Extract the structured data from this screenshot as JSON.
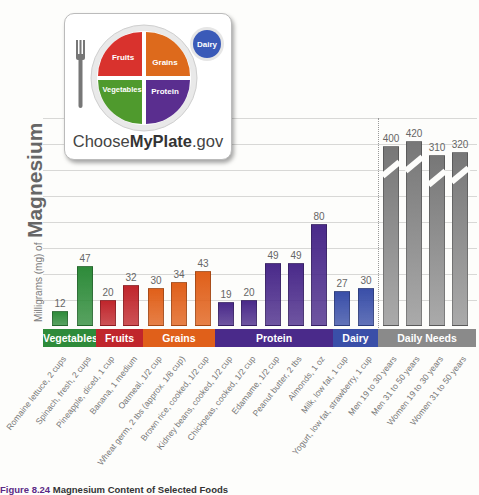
{
  "logo": {
    "sections": [
      "Fruits",
      "Grains",
      "Vegetables",
      "Protein"
    ],
    "dairy": "Dairy",
    "brand_prefix": "Choose",
    "brand_bold": "MyPlate",
    "brand_suffix": ".gov"
  },
  "y_axis": {
    "small": "Milligrams (mg) of",
    "big": "Magnesium"
  },
  "caption": {
    "label": "Figure 8.24",
    "text": "Magnesium Content of Selected Foods"
  },
  "bands": [
    {
      "name": "Vegetables",
      "color": "#2e8b3a"
    },
    {
      "name": "Fruits",
      "color": "#c0262c"
    },
    {
      "name": "Grains",
      "color": "#e0601a"
    },
    {
      "name": "Protein",
      "color": "#4a2a8a"
    },
    {
      "name": "Dairy",
      "color": "#3a4fa8"
    },
    {
      "name": "Daily Needs",
      "color": "#8a8a8a"
    }
  ],
  "chart_data": {
    "type": "bar",
    "title": "Magnesium Content of Selected Foods",
    "ylabel": "Milligrams (mg) of Magnesium",
    "xlabel": "",
    "grid": true,
    "categories": [
      "Romaine lettuce, 2 cups",
      "Spinach, fresh, 2 cups",
      "Pineapple, diced, 1 cup",
      "Banana, 1 medium",
      "Oatmeal, 1/2 cup",
      "Wheat germ, 2 tbs (approx. 1/8 cup)",
      "Brown rice, cooked, 1/2 cup",
      "Kidney beans, cooked, 1/2 cup",
      "Chickpeas, cooked, 1/2 cup",
      "Edamame, 1/2 cup",
      "Peanut butter, 2 tbs",
      "Almonds, 1 oz",
      "Milk, low fat, 1 cup",
      "Yogurt, low fat, strawberry, 1 cup",
      "Men 19 to 30 years",
      "Men 31 to 50 years",
      "Women 19 to 30 years",
      "Women 31 to 50 years"
    ],
    "values": [
      12,
      47,
      20,
      32,
      30,
      34,
      43,
      19,
      20,
      49,
      49,
      80,
      27,
      30,
      400,
      420,
      310,
      320
    ],
    "groups": [
      "Vegetables",
      "Vegetables",
      "Fruits",
      "Fruits",
      "Grains",
      "Grains",
      "Grains",
      "Protein",
      "Protein",
      "Protein",
      "Protein",
      "Protein",
      "Dairy",
      "Dairy",
      "Daily Needs",
      "Daily Needs",
      "Daily Needs",
      "Daily Needs"
    ],
    "axis_break": "Daily Needs bars are truncated with a break mark"
  }
}
